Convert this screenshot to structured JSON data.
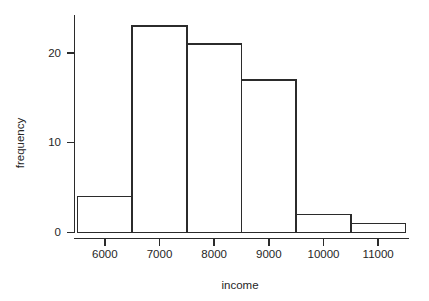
{
  "chart_data": {
    "type": "bar",
    "title": "",
    "subtitle": "",
    "xlabel": "income",
    "ylabel": "frequency",
    "categories": [
      "5500-6500",
      "6500-7500",
      "7500-8500",
      "8500-9500",
      "9500-10500",
      "10500-11500"
    ],
    "bin_edges": [
      5500,
      6500,
      7500,
      8500,
      9500,
      10500,
      11500
    ],
    "values": [
      4,
      23,
      21,
      17,
      2,
      1
    ],
    "bin_centers": [
      6000,
      7000,
      8000,
      9000,
      10000,
      11000
    ],
    "xlim": [
      5500,
      11500
    ],
    "ylim": [
      0,
      23
    ],
    "x_ticks": [
      6000,
      7000,
      8000,
      9000,
      10000,
      11000
    ],
    "x_tick_labels": [
      "6000",
      "7000",
      "8000",
      "9000",
      "10000",
      "11000"
    ],
    "y_ticks": [
      0,
      10,
      20
    ],
    "y_tick_labels": [
      "0",
      "10",
      "20"
    ],
    "grid": false,
    "legend": false,
    "legend_position": "none",
    "bar_fill": "#ffffff",
    "bar_stroke": "#2b2b2b",
    "axis_color": "#2b2b2b",
    "background": "#ffffff"
  }
}
